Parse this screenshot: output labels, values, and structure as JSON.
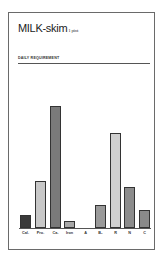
{
  "title": {
    "main": "MILK-skim",
    "serving": "1 pint"
  },
  "section_label": "DAILY REQUIREMENT",
  "chart_data": {
    "type": "bar",
    "subtitle": "DAILY REQUIREMENT",
    "xlabel": "",
    "ylabel": "",
    "units": "relative bar height (px, approx)",
    "categories": [
      "Cal.",
      "Pro.",
      "Ca.",
      "Iron",
      "A",
      "B₁",
      "R",
      "N",
      "C"
    ],
    "values": [
      13,
      47,
      122,
      7,
      0,
      23,
      95,
      41,
      18
    ],
    "colors": [
      "#3a3a3a",
      "#c8c8c8",
      "#7a7a7a",
      "#a8a8a8",
      "#ffffff",
      "#9a9a9a",
      "#d0d0d0",
      "#8c8c8c",
      "#8a8a8a"
    ],
    "grid": false,
    "legend": "none",
    "ylim": [
      0,
      122
    ]
  },
  "bars": [
    {
      "label": "Cal.",
      "height": 13,
      "left": 20,
      "color": "#3a3a3a"
    },
    {
      "label": "Pro.",
      "height": 47,
      "left": 35,
      "color": "#c8c8c8"
    },
    {
      "label": "Ca.",
      "height": 122,
      "left": 50,
      "color": "#7a7a7a"
    },
    {
      "label": "Iron",
      "height": 7,
      "left": 64,
      "color": "#a8a8a8"
    },
    {
      "label": "A",
      "height": 0,
      "left": 80,
      "color": "#ffffff"
    },
    {
      "label": "B₁",
      "height": 23,
      "left": 95,
      "color": "#9a9a9a"
    },
    {
      "label": "R",
      "height": 95,
      "left": 110,
      "color": "#d0d0d0"
    },
    {
      "label": "N",
      "height": 41,
      "left": 124,
      "color": "#8c8c8c"
    },
    {
      "label": "C",
      "height": 18,
      "left": 139,
      "color": "#8a8a8a"
    }
  ]
}
